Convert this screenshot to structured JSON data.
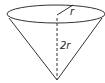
{
  "diagram": {
    "labels": {
      "radius": "r",
      "height": "2r"
    },
    "colors": {
      "stroke": "#333333",
      "background": "#ffffff"
    }
  }
}
